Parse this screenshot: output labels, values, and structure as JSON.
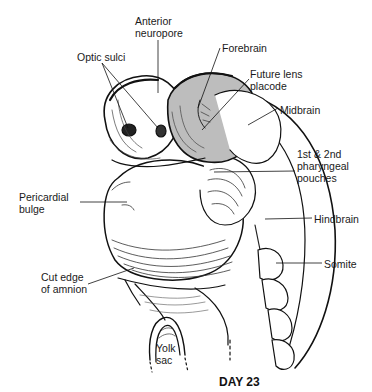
{
  "figure": {
    "caption": "DAY 23",
    "colors": {
      "ink": "#111111",
      "shade": "#bdbdbd",
      "background": "#ffffff"
    },
    "labels": [
      {
        "id": "anterior-neuropore",
        "text": "Anterior\nneuropore",
        "x": 135,
        "y": 15
      },
      {
        "id": "optic-sulci",
        "text": "Optic sulci",
        "x": 77,
        "y": 51
      },
      {
        "id": "forebrain",
        "text": "Forebrain",
        "x": 222,
        "y": 42
      },
      {
        "id": "future-lens-placode",
        "text": "Future lens\nplacode",
        "x": 250,
        "y": 68
      },
      {
        "id": "midbrain",
        "text": "Midbrain",
        "x": 280,
        "y": 104
      },
      {
        "id": "pharyngeal-pouches",
        "text": "1st & 2nd\npharyngeal\npouches",
        "x": 297,
        "y": 148
      },
      {
        "id": "pericardial-bulge",
        "text": "Pericardial\nbulge",
        "x": 19,
        "y": 191
      },
      {
        "id": "hindbrain",
        "text": "Hindbrain",
        "x": 314,
        "y": 213
      },
      {
        "id": "somite",
        "text": "Somite",
        "x": 324,
        "y": 258
      },
      {
        "id": "cut-edge-amnion",
        "text": "Cut edge\nof amnion",
        "x": 41,
        "y": 271
      },
      {
        "id": "yolk-sac",
        "text": "Yolk\nsac",
        "x": 156,
        "y": 342
      }
    ]
  }
}
